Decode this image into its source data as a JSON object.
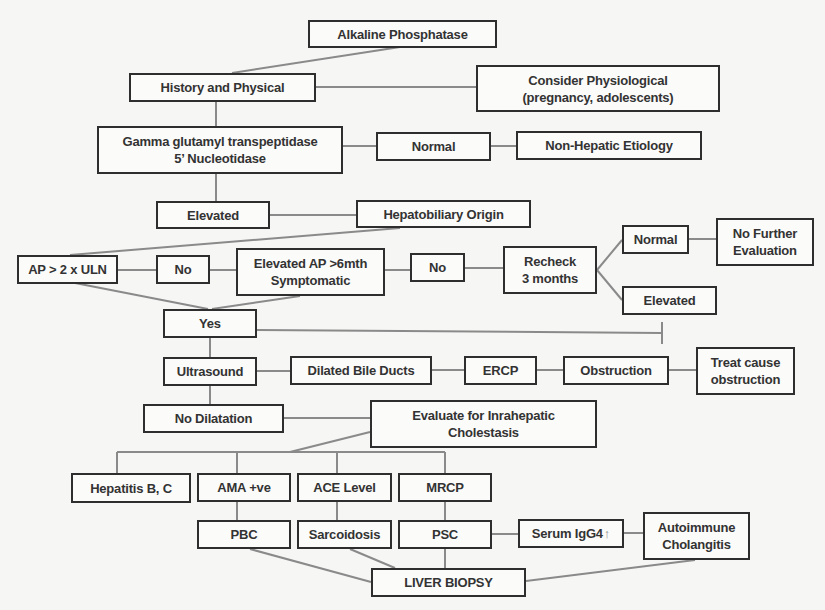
{
  "flowchart": {
    "title": "Alkaline Phosphatase",
    "nodes": {
      "alkaline_phosphatase": "Alkaline Phosphatase",
      "history_physical": "History and Physical",
      "consider_physiological": "Consider Physiological\n(pregnancy, adolescents)",
      "ggt_5nt": "Gamma glutamyl transpeptidase\n5’ Nucleotidase",
      "normal_1": "Normal",
      "non_hepatic": "Non-Hepatic Etiology",
      "elevated_1": "Elevated",
      "hepatobiliary_origin": "Hepatobiliary  Origin",
      "ap_2x_uln": "AP > 2 x ULN",
      "no_1": "No",
      "elevated_ap_6mth": "Elevated AP >6mth\nSymptomatic",
      "no_2": "No",
      "recheck_3_months": "Recheck\n3 months",
      "normal_2": "Normal",
      "no_further_evaluation": "No Further\nEvaluation",
      "elevated_2": "Elevated",
      "yes": "Yes",
      "ultrasound": "Ultrasound",
      "dilated_bile_ducts": "Dilated Bile Ducts",
      "ercp": "ERCP",
      "obstruction": "Obstruction",
      "treat_cause_obstruction": "Treat cause\nobstruction",
      "no_dilatation": "No Dilatation",
      "evaluate_intrahepatic": "Evaluate for Inrahepatic\nCholestasis",
      "hepatitis_bc": "Hepatitis B, C",
      "ama_positive": "AMA +ve",
      "ace_level": "ACE Level",
      "mrcp": "MRCP",
      "pbc": "PBC",
      "sarcoidosis": "Sarcoidosis",
      "psc": "PSC",
      "serum_igg4": "Serum IgG4",
      "serum_igg4_arrow": "↑",
      "autoimmune_cholangitis": "Autoimmune\nCholangitis",
      "liver_biopsy": "LIVER BIOPSY"
    },
    "colors": {
      "box_border": "#2e2e2e",
      "connector": "#8a8a8a",
      "background": "#f6f6f4"
    }
  }
}
